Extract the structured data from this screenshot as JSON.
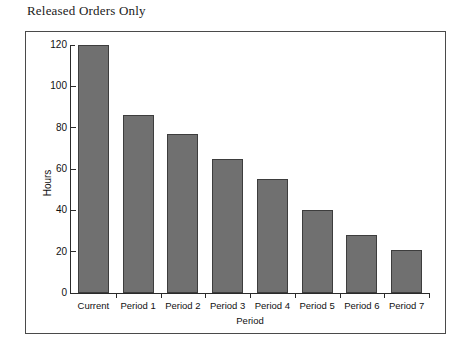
{
  "page": {
    "title": "Released Orders Only"
  },
  "chart_data": {
    "type": "bar",
    "title": "Released Orders Only",
    "xlabel": "Period",
    "ylabel": "Hours",
    "categories": [
      "Current",
      "Period 1",
      "Period 2",
      "Period 3",
      "Period 4",
      "Period 5",
      "Period 6",
      "Period 7"
    ],
    "values": [
      120,
      86,
      77,
      65,
      55,
      40,
      28,
      21
    ],
    "ylim": [
      0,
      120
    ],
    "yticks": [
      0,
      20,
      40,
      60,
      80,
      100,
      120
    ],
    "ytick_labels": [
      "0",
      "20",
      "40",
      "60",
      "80",
      "100",
      "120"
    ],
    "grid": false,
    "legend": null,
    "bar_color": "#707070",
    "bar_edge_color": "#3d3d3d",
    "axis_color": "#2a2a2a",
    "frame_color": "#4a4a4a"
  }
}
